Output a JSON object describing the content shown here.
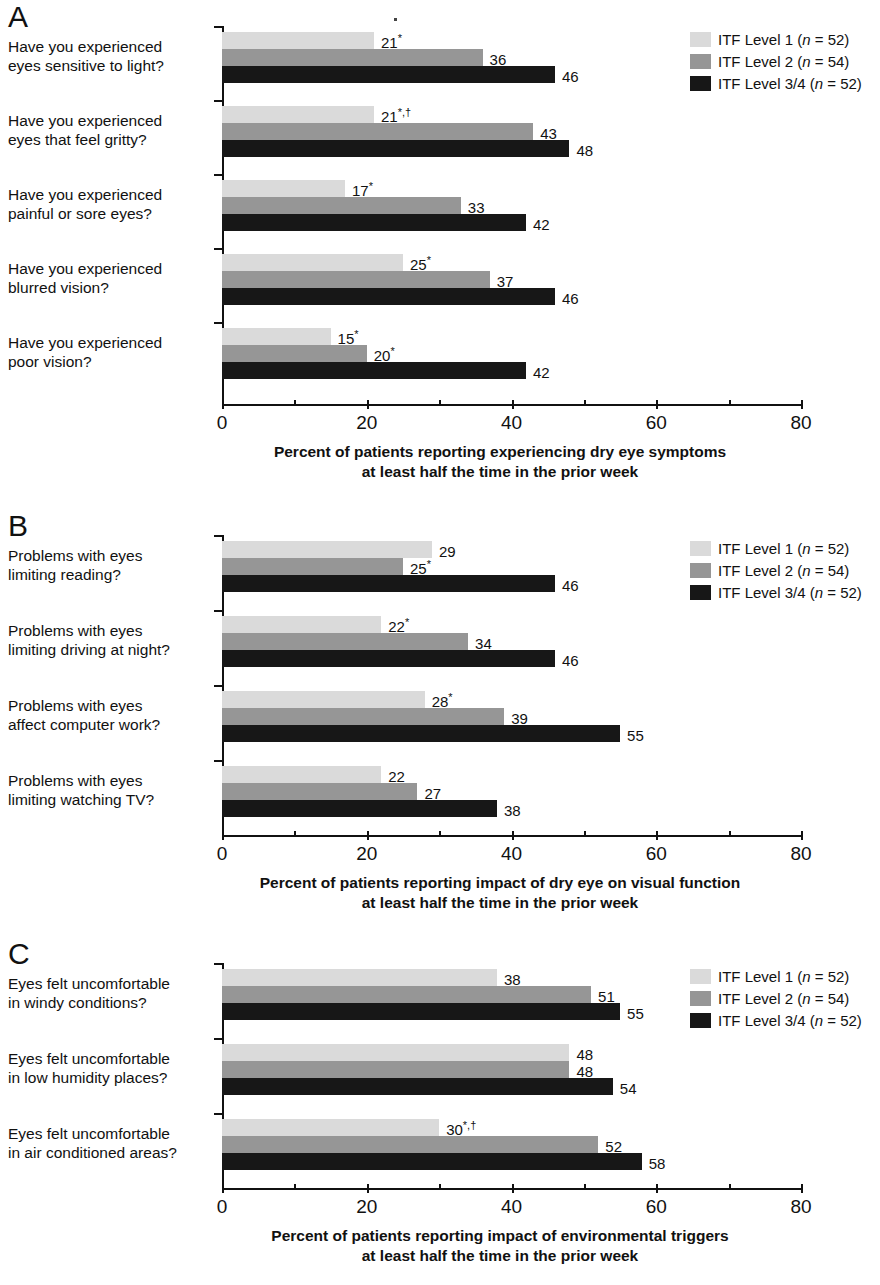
{
  "figure": {
    "panels": [
      "A",
      "B",
      "C"
    ],
    "legend": [
      {
        "label_prefix": "ITF Level 1 (",
        "n_text": "n",
        "n_value": " = 52)",
        "color": "#dadada",
        "series": "ITF Level 1",
        "n": 52
      },
      {
        "label_prefix": "ITF Level 2 (",
        "n_text": "n",
        "n_value": " = 54)",
        "color": "#969696",
        "series": "ITF Level 2",
        "n": 54
      },
      {
        "label_prefix": "ITF Level 3/4 (",
        "n_text": "n",
        "n_value": " = 52)",
        "color": "#171717",
        "series": "ITF Level 3/4",
        "n": 52
      }
    ]
  },
  "chart_data": [
    {
      "panel": "A",
      "type": "bar",
      "orientation": "horizontal",
      "title": "A",
      "xlabel_line1": "Percent of patients reporting experiencing dry eye symptoms",
      "xlabel_line2": "at least half the time in the prior week",
      "ylabel": "",
      "xlim": [
        0,
        80
      ],
      "xticks": [
        0,
        20,
        40,
        60,
        80
      ],
      "xtick_labels": [
        "0",
        "20",
        "40",
        "60",
        "80"
      ],
      "xminor_ticks": [
        10,
        30,
        50,
        70
      ],
      "grid": false,
      "legend_position": "top-right",
      "categories": [
        [
          "Have you experienced",
          "eyes sensitive to light?"
        ],
        [
          "Have you experienced",
          "eyes that feel gritty?"
        ],
        [
          "Have you experienced",
          "painful or sore eyes?"
        ],
        [
          "Have you experienced",
          "blurred vision?"
        ],
        [
          "Have you experienced",
          "poor vision?"
        ]
      ],
      "series": [
        {
          "name": "ITF Level 1",
          "color": "#dadada",
          "values": [
            21,
            21,
            17,
            25,
            15
          ],
          "labels": [
            "21*",
            "21*,†",
            "17*",
            "25*",
            "15*"
          ]
        },
        {
          "name": "ITF Level 2",
          "color": "#969696",
          "values": [
            36,
            43,
            33,
            37,
            20
          ],
          "labels": [
            "36",
            "43",
            "33",
            "37",
            "20*"
          ]
        },
        {
          "name": "ITF Level 3/4",
          "color": "#171717",
          "values": [
            46,
            48,
            42,
            46,
            42
          ],
          "labels": [
            "46",
            "48",
            "42",
            "46",
            "42"
          ]
        }
      ]
    },
    {
      "panel": "B",
      "type": "bar",
      "orientation": "horizontal",
      "title": "B",
      "xlabel_line1": "Percent of patients reporting impact of dry eye on visual function",
      "xlabel_line2": "at least half the time in the prior week",
      "ylabel": "",
      "xlim": [
        0,
        80
      ],
      "xticks": [
        0,
        20,
        40,
        60,
        80
      ],
      "xtick_labels": [
        "0",
        "20",
        "40",
        "60",
        "80"
      ],
      "xminor_ticks": [
        10,
        30,
        50,
        70
      ],
      "grid": false,
      "legend_position": "top-right",
      "categories": [
        [
          "Problems with eyes",
          "limiting reading?"
        ],
        [
          "Problems with eyes",
          "limiting driving at night?"
        ],
        [
          "Problems with eyes",
          "affect computer work?"
        ],
        [
          "Problems with eyes",
          "limiting watching TV?"
        ]
      ],
      "series": [
        {
          "name": "ITF Level 1",
          "color": "#dadada",
          "values": [
            29,
            22,
            28,
            22
          ],
          "labels": [
            "29",
            "22*",
            "28*",
            "22"
          ]
        },
        {
          "name": "ITF Level 2",
          "color": "#969696",
          "values": [
            25,
            34,
            39,
            27
          ],
          "labels": [
            "25*",
            "34",
            "39",
            "27"
          ]
        },
        {
          "name": "ITF Level 3/4",
          "color": "#171717",
          "values": [
            46,
            46,
            55,
            38
          ],
          "labels": [
            "46",
            "46",
            "55",
            "38"
          ]
        }
      ]
    },
    {
      "panel": "C",
      "type": "bar",
      "orientation": "horizontal",
      "title": "C",
      "xlabel_line1": "Percent of patients reporting impact of environmental triggers",
      "xlabel_line2": "at least half the time in the prior week",
      "ylabel": "",
      "xlim": [
        0,
        80
      ],
      "xticks": [
        0,
        20,
        40,
        60,
        80
      ],
      "xtick_labels": [
        "0",
        "20",
        "40",
        "60",
        "80"
      ],
      "xminor_ticks": [
        10,
        30,
        50,
        70
      ],
      "grid": false,
      "legend_position": "top-right",
      "categories": [
        [
          "Eyes felt uncomfortable",
          "in windy conditions?"
        ],
        [
          "Eyes felt uncomfortable",
          "in low humidity places?"
        ],
        [
          "Eyes felt uncomfortable",
          "in air conditioned areas?"
        ]
      ],
      "series": [
        {
          "name": "ITF Level 1",
          "color": "#dadada",
          "values": [
            38,
            48,
            30
          ],
          "labels": [
            "38",
            "48",
            "30*,†"
          ]
        },
        {
          "name": "ITF Level 2",
          "color": "#969696",
          "values": [
            51,
            48,
            52
          ],
          "labels": [
            "51",
            "48",
            "52"
          ]
        },
        {
          "name": "ITF Level 3/4",
          "color": "#171717",
          "values": [
            55,
            54,
            58
          ],
          "labels": [
            "55",
            "54",
            "58"
          ]
        }
      ]
    }
  ]
}
